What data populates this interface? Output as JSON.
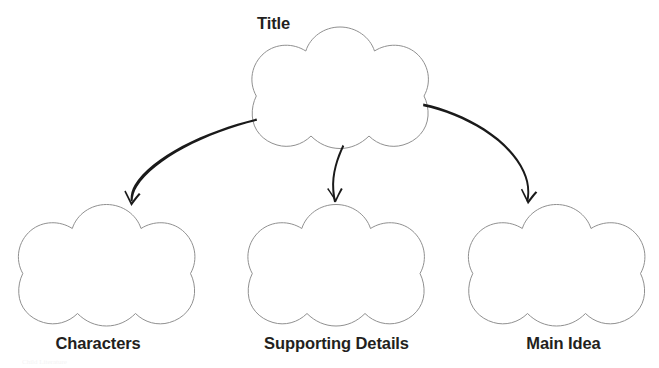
{
  "page": {
    "width": 659,
    "height": 368,
    "background_color": "#ffffff",
    "faint_bottom_artifact_text": "Child Literature"
  },
  "style": {
    "shape_outline_color": "#909090",
    "shape_fill_color": "#ffffff",
    "shape_outline_width": 1,
    "arrow_color": "#1a1a1a",
    "label_color": "#231f20"
  },
  "diagram": {
    "type": "hierarchy-cluster",
    "root": {
      "id": "title",
      "label": "Title",
      "shape": "five-lobed-cloud",
      "label_position": "top-left-outside",
      "box": {
        "x": 252,
        "y": 26,
        "width": 176,
        "height": 124
      }
    },
    "children": [
      {
        "id": "characters",
        "label": "Characters",
        "shape": "five-lobed-cloud",
        "label_position": "below",
        "box": {
          "x": 18,
          "y": 203,
          "width": 177,
          "height": 124
        }
      },
      {
        "id": "supporting-details",
        "label": "Supporting Details",
        "shape": "five-lobed-cloud",
        "label_position": "below",
        "box": {
          "x": 248,
          "y": 203,
          "width": 176,
          "height": 124
        }
      },
      {
        "id": "main-idea",
        "label": "Main Idea",
        "shape": "five-lobed-cloud",
        "label_position": "below",
        "box": {
          "x": 468,
          "y": 203,
          "width": 177,
          "height": 124
        }
      }
    ],
    "connectors": [
      {
        "id": "arrow-title-to-characters",
        "style": "hand-drawn-curved-arrow",
        "from": "title",
        "to": "characters",
        "start": {
          "x": 256,
          "y": 119
        },
        "end": {
          "x": 131,
          "y": 206
        },
        "curve": "concave-down-left"
      },
      {
        "id": "arrow-title-to-supporting-details",
        "style": "hand-drawn-curved-arrow",
        "from": "title",
        "to": "supporting-details",
        "start": {
          "x": 345,
          "y": 146
        },
        "end": {
          "x": 335,
          "y": 202
        },
        "curve": "slight-s-curve-down"
      },
      {
        "id": "arrow-title-to-main-idea",
        "style": "hand-drawn-curved-arrow",
        "from": "title",
        "to": "main-idea",
        "start": {
          "x": 423,
          "y": 104
        },
        "end": {
          "x": 529,
          "y": 202
        },
        "curve": "concave-down-right"
      }
    ]
  }
}
